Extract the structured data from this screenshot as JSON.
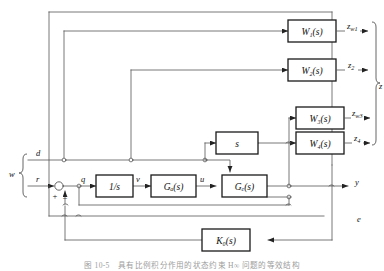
{
  "figure": {
    "type": "control-system-block-diagram",
    "caption": "图 10-5　具有比例积分作用的状态约束 H∞ 问题的等效结构"
  },
  "colors": {
    "line": "#555555",
    "block_border": "#1a1a1a",
    "text": "#111111",
    "background": "#ffffff"
  },
  "blocks": [
    {
      "id": "w1",
      "label": "W",
      "subscript": "1",
      "suffix": "(s)"
    },
    {
      "id": "w2",
      "label": "W",
      "subscript": "2",
      "suffix": "(s)"
    },
    {
      "id": "w3",
      "label": "W",
      "subscript": "3",
      "suffix": "(s)"
    },
    {
      "id": "w4",
      "label": "W",
      "subscript": "4",
      "suffix": "(s)"
    },
    {
      "id": "diff",
      "label": "s",
      "subscript": "",
      "suffix": ""
    },
    {
      "id": "integrator",
      "label": "1/s",
      "subscript": "",
      "suffix": ""
    },
    {
      "id": "ga",
      "label": "G",
      "subscript": "a",
      "suffix": "(s)"
    },
    {
      "id": "ge",
      "label": "G",
      "subscript": "e",
      "suffix": "(s)"
    },
    {
      "id": "k0",
      "label": "K",
      "subscript": "0",
      "suffix": "(s)"
    }
  ],
  "block_text": {
    "w1": "W₁(s)",
    "w2": "W₂(s)",
    "w3": "W₃(s)",
    "w4": "W₄(s)",
    "diff": "s",
    "integrator": "1/s",
    "ga": "Gₐ(s)",
    "ge": "Gₑ(s)",
    "k0": "K₀(s)"
  },
  "outputs": {
    "z_w1": "z",
    "z_w1_sub": "w1",
    "z_2": "z",
    "z_2_sub": "2",
    "z_w3": "z",
    "z_w3_sub": "w3",
    "z_4": "z",
    "z_4_sub": "4",
    "z_group": "z",
    "y": "y",
    "e": "e"
  },
  "inputs": {
    "w_group": "w",
    "d": "d",
    "r": "r"
  },
  "signals": {
    "q": "q",
    "v": "v",
    "u": "u"
  },
  "summing_junction": {
    "plus": "+",
    "minus": "−"
  }
}
